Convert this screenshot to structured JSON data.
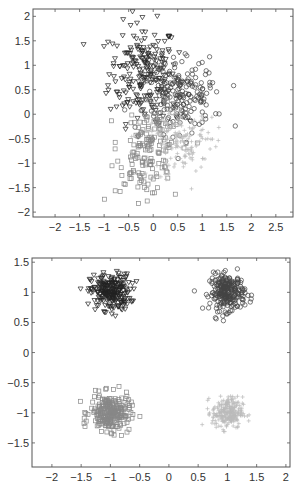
{
  "chart_data": [
    {
      "type": "scatter",
      "title": "",
      "xlabel": "",
      "ylabel": "",
      "xlim": [
        -2.45,
        2.85
      ],
      "ylim": [
        -2.1,
        2.15
      ],
      "xticks": [
        -2,
        -1.5,
        -1,
        -0.5,
        0,
        0.5,
        1,
        1.5,
        2,
        2.5
      ],
      "xtick_labels": [
        "−2",
        "−1.5",
        "−1",
        "−0.5",
        "0",
        "0.5",
        "1",
        "1.5",
        "2",
        "2.5"
      ],
      "yticks": [
        2,
        1.5,
        1,
        0.5,
        0,
        -0.5,
        -1,
        -1.5,
        -2
      ],
      "ytick_labels": [
        "2",
        "1.5",
        "1",
        "0.5",
        "0",
        "−0.5",
        "−1",
        "−1.5",
        "−2"
      ],
      "grid": false,
      "legend": null,
      "series": [
        {
          "name": "class-triangle",
          "marker": "triangle-down",
          "color": "#222222",
          "center": [
            -0.2,
            0.85
          ],
          "spread": [
            0.35,
            0.5
          ],
          "count": 220,
          "rotation": 0.0
        },
        {
          "name": "class-circle",
          "marker": "circle",
          "color": "#444444",
          "center": [
            0.55,
            0.35
          ],
          "spread": [
            0.4,
            0.35
          ],
          "count": 200,
          "rotation": 0.3
        },
        {
          "name": "class-square",
          "marker": "square",
          "color": "#888888",
          "center": [
            -0.1,
            -0.75
          ],
          "spread": [
            0.3,
            0.45
          ],
          "count": 160,
          "rotation": -0.2
        },
        {
          "name": "class-plus",
          "marker": "plus",
          "color": "#bbbbbb",
          "center": [
            0.55,
            -0.55
          ],
          "spread": [
            0.35,
            0.35
          ],
          "count": 160,
          "rotation": 0.3
        }
      ]
    },
    {
      "type": "scatter",
      "title": "",
      "xlabel": "",
      "ylabel": "",
      "xlim": [
        -2.34,
        2.07
      ],
      "ylim": [
        -1.9,
        1.57
      ],
      "xticks": [
        -2,
        -1.5,
        -1,
        -0.5,
        0,
        0.5,
        1,
        1.5,
        2
      ],
      "xtick_labels": [
        "−2",
        "−1.5",
        "−1",
        "−0.5",
        "0",
        "0.5",
        "1",
        "1.5",
        "2"
      ],
      "yticks": [
        1.5,
        1,
        0.5,
        0,
        -0.5,
        -1,
        -1.5
      ],
      "ytick_labels": [
        "1.5",
        "1",
        "0.5",
        "0",
        "−0.5",
        "−1",
        "−1.5"
      ],
      "grid": false,
      "legend": null,
      "series": [
        {
          "name": "class-triangle",
          "marker": "triangle-down",
          "color": "#222222",
          "center": [
            -1.0,
            1.0
          ],
          "spread": [
            0.17,
            0.15
          ],
          "count": 250,
          "rotation": 0.0
        },
        {
          "name": "class-circle",
          "marker": "circle",
          "color": "#444444",
          "center": [
            1.0,
            1.0
          ],
          "spread": [
            0.15,
            0.15
          ],
          "count": 250,
          "rotation": 0.0
        },
        {
          "name": "class-square",
          "marker": "square",
          "color": "#888888",
          "center": [
            -1.0,
            -1.0
          ],
          "spread": [
            0.17,
            0.15
          ],
          "count": 250,
          "rotation": 0.0
        },
        {
          "name": "class-plus",
          "marker": "plus",
          "color": "#bbbbbb",
          "center": [
            1.0,
            -1.0
          ],
          "spread": [
            0.13,
            0.13
          ],
          "count": 250,
          "rotation": 0.0
        }
      ]
    }
  ],
  "layout": {
    "plots": [
      {
        "box": {
          "left": 33,
          "top": 9,
          "right": 293,
          "bottom": 217
        },
        "offset_y": 0
      },
      {
        "box": {
          "left": 32,
          "top": 10,
          "right": 290,
          "bottom": 219
        },
        "offset_y": 248
      }
    ]
  }
}
